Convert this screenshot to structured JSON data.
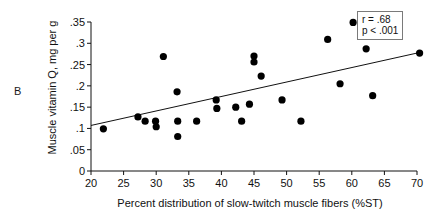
{
  "figure": {
    "panel_label": "B",
    "ylabel": "Muscle vitamin Q, mg per g",
    "xlabel": "Percent distribution of slow-twitch muscle fibers (%ST)"
  },
  "stats": {
    "correlation": "r = .68",
    "pvalue": "p < .001"
  },
  "chart_data": {
    "type": "scatter",
    "title": "",
    "xlabel": "Percent distribution of slow-twitch muscle fibers (%ST)",
    "ylabel": "Muscle vitamin Q, mg per g",
    "xlim": [
      20,
      70
    ],
    "ylim": [
      0,
      0.35
    ],
    "xticks": [
      20,
      25,
      30,
      35,
      40,
      45,
      50,
      55,
      60,
      65,
      70
    ],
    "xticklabels": [
      "20",
      "25",
      "30",
      "35",
      "40",
      "45",
      "50",
      "55",
      "60",
      "65",
      "70"
    ],
    "yticks": [
      0,
      0.05,
      0.1,
      0.15,
      0.2,
      0.25,
      0.3,
      0.35
    ],
    "yticklabels": [
      "0",
      ".05",
      ".1",
      ".15",
      ".2",
      ".25",
      ".3",
      ".35"
    ],
    "grid": false,
    "legend": false,
    "annotations": [
      "r = .68",
      "p < .001"
    ],
    "marker": "filled-circle",
    "marker_color": "#000000",
    "points": [
      {
        "x": 21.9,
        "y": 0.099
      },
      {
        "x": 27.2,
        "y": 0.127
      },
      {
        "x": 28.3,
        "y": 0.117
      },
      {
        "x": 29.9,
        "y": 0.117
      },
      {
        "x": 30.0,
        "y": 0.104
      },
      {
        "x": 31.1,
        "y": 0.269
      },
      {
        "x": 33.2,
        "y": 0.186
      },
      {
        "x": 33.3,
        "y": 0.117
      },
      {
        "x": 33.3,
        "y": 0.081
      },
      {
        "x": 36.2,
        "y": 0.117
      },
      {
        "x": 39.2,
        "y": 0.167
      },
      {
        "x": 39.3,
        "y": 0.147
      },
      {
        "x": 42.2,
        "y": 0.15
      },
      {
        "x": 43.1,
        "y": 0.117
      },
      {
        "x": 44.3,
        "y": 0.157
      },
      {
        "x": 45.0,
        "y": 0.27
      },
      {
        "x": 45.0,
        "y": 0.256
      },
      {
        "x": 46.1,
        "y": 0.223
      },
      {
        "x": 49.3,
        "y": 0.167
      },
      {
        "x": 52.2,
        "y": 0.117
      },
      {
        "x": 56.3,
        "y": 0.309
      },
      {
        "x": 58.2,
        "y": 0.205
      },
      {
        "x": 60.2,
        "y": 0.349
      },
      {
        "x": 62.2,
        "y": 0.287
      },
      {
        "x": 63.2,
        "y": 0.177
      },
      {
        "x": 70.4,
        "y": 0.277
      }
    ],
    "regression_line": {
      "x_start": 20.0,
      "y_start": 0.107,
      "x_end": 70.0,
      "y_end": 0.277
    }
  },
  "axes_geometry": {
    "left_px": 91,
    "right_px": 417,
    "bottom_px": 171,
    "top_px": 22
  }
}
